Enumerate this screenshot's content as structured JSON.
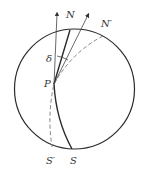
{
  "diagram": {
    "labels": {
      "N": "N",
      "N_prime": "N′",
      "S": "S",
      "S_prime": "S′",
      "P": "P",
      "delta": "δ"
    },
    "colors": {
      "stroke": "#2a2a2a",
      "thin_stroke": "#555555",
      "dashed": "#777777",
      "background": "#ffffff"
    }
  }
}
